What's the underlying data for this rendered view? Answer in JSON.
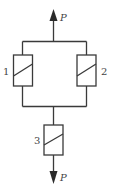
{
  "diagram": {
    "title": "",
    "load_top": {
      "label": "P",
      "direction": "up"
    },
    "load_bottom": {
      "label": "P",
      "direction": "down"
    },
    "elements": [
      {
        "id": "1",
        "label": "1",
        "position": "left-parallel"
      },
      {
        "id": "2",
        "label": "2",
        "position": "right-parallel"
      },
      {
        "id": "3",
        "label": "3",
        "position": "series-bottom"
      }
    ],
    "colors": {
      "line": "#3a3a3a",
      "text": "#444444",
      "background": "#ffffff"
    }
  }
}
